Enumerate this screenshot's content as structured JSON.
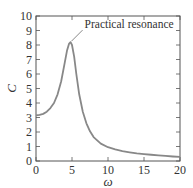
{
  "chart_data": {
    "type": "line",
    "title": "",
    "xlabel": "ω",
    "ylabel": "C",
    "xlim": [
      0,
      20
    ],
    "ylim": [
      0,
      10
    ],
    "xticks": [
      0,
      5,
      10,
      15,
      20
    ],
    "yticks": [
      0,
      1,
      2,
      3,
      4,
      5,
      6,
      7,
      8,
      9,
      10
    ],
    "grid": false,
    "legend": null,
    "series": [
      {
        "name": "C(ω)",
        "color": "#888888",
        "x": [
          0,
          0.5,
          1,
          1.5,
          2,
          2.5,
          3,
          3.5,
          4,
          4.3,
          4.6,
          4.8,
          5.0,
          5.3,
          5.6,
          6,
          6.5,
          7,
          7.5,
          8,
          9,
          10,
          11,
          12,
          13,
          14,
          15,
          16,
          17,
          18,
          19,
          20
        ],
        "values": [
          3.15,
          3.18,
          3.25,
          3.4,
          3.65,
          4.0,
          4.6,
          5.5,
          6.8,
          7.6,
          8.1,
          8.2,
          8.0,
          7.2,
          6.0,
          4.6,
          3.4,
          2.6,
          2.05,
          1.65,
          1.2,
          0.95,
          0.8,
          0.68,
          0.6,
          0.53,
          0.48,
          0.43,
          0.39,
          0.35,
          0.31,
          0.28
        ]
      }
    ],
    "annotations": [
      {
        "text": "Practical resonance",
        "x": 4.8,
        "y": 8.2
      }
    ]
  }
}
